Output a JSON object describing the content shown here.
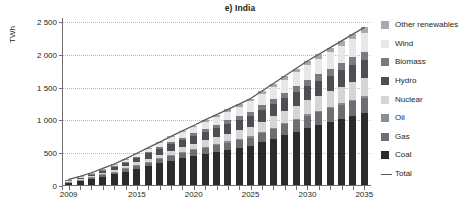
{
  "chart_data": {
    "type": "bar",
    "stacked": true,
    "title": "e) India",
    "xlabel": "",
    "ylabel": "TWh",
    "ylim": [
      0,
      2500
    ],
    "yticks": [
      0,
      500,
      1000,
      1500,
      2000,
      2500
    ],
    "ytick_labels": [
      "0",
      "500",
      "1 000",
      "1 500",
      "2 000",
      "2 500"
    ],
    "grid": true,
    "legend_position": "right",
    "categories": [
      2009,
      2010,
      2011,
      2012,
      2013,
      2014,
      2015,
      2016,
      2017,
      2018,
      2019,
      2020,
      2021,
      2022,
      2023,
      2024,
      2025,
      2026,
      2027,
      2028,
      2029,
      2030,
      2031,
      2032,
      2033,
      2034,
      2035
    ],
    "xtick_labels": [
      "2009",
      "2015",
      "2020",
      "2025",
      "2030",
      "2035"
    ],
    "xticks": [
      2009,
      2015,
      2020,
      2025,
      2030,
      2035
    ],
    "series": [
      {
        "name": "Coal",
        "color": "#2b2b2b",
        "values": [
          55,
          80,
          110,
          145,
          180,
          220,
          265,
          305,
          345,
          385,
          420,
          455,
          490,
          520,
          550,
          580,
          610,
          665,
          720,
          775,
          830,
          885,
          930,
          975,
          1020,
          1065,
          1110
        ]
      },
      {
        "name": "Gas",
        "color": "#6d6e71",
        "values": [
          8,
          12,
          18,
          24,
          31,
          39,
          47,
          56,
          64,
          72,
          80,
          88,
          96,
          104,
          112,
          120,
          128,
          140,
          152,
          164,
          176,
          188,
          198,
          208,
          218,
          228,
          238
        ]
      },
      {
        "name": "Oil",
        "color": "#8c8d8f",
        "values": [
          4,
          5,
          6,
          7,
          8,
          9,
          10,
          11,
          12,
          13,
          14,
          15,
          16,
          16,
          17,
          17,
          18,
          18,
          19,
          19,
          20,
          20,
          21,
          21,
          22,
          22,
          23
        ]
      },
      {
        "name": "Nuclear",
        "color": "#d4d5d7",
        "values": [
          5,
          8,
          12,
          17,
          23,
          30,
          38,
          47,
          56,
          66,
          76,
          86,
          97,
          108,
          119,
          130,
          142,
          156,
          170,
          184,
          198,
          212,
          226,
          240,
          254,
          268,
          282
        ]
      },
      {
        "name": "Hydro",
        "color": "#4e4f52",
        "values": [
          20,
          26,
          33,
          41,
          49,
          58,
          67,
          77,
          87,
          97,
          107,
          117,
          127,
          137,
          147,
          157,
          167,
          177,
          187,
          197,
          207,
          217,
          227,
          237,
          247,
          257,
          267
        ]
      },
      {
        "name": "Biomass",
        "color": "#7a7b7e",
        "values": [
          3,
          5,
          7,
          10,
          13,
          16,
          20,
          24,
          28,
          32,
          37,
          42,
          47,
          52,
          57,
          62,
          68,
          74,
          80,
          86,
          92,
          98,
          104,
          110,
          116,
          122,
          128
        ]
      },
      {
        "name": "Wind",
        "color": "#e6e7e8",
        "values": [
          5,
          9,
          14,
          20,
          27,
          35,
          44,
          54,
          64,
          75,
          86,
          97,
          109,
          121,
          133,
          145,
          158,
          171,
          184,
          197,
          210,
          223,
          236,
          249,
          262,
          275,
          288
        ]
      },
      {
        "name": "Other renewables",
        "color": "#a7a9ac",
        "values": [
          0,
          1,
          2,
          3,
          4,
          6,
          8,
          10,
          13,
          16,
          19,
          22,
          26,
          30,
          34,
          38,
          42,
          46,
          50,
          54,
          58,
          62,
          66,
          70,
          74,
          78,
          82
        ]
      }
    ],
    "total_line": {
      "name": "Total",
      "color": "#58595b",
      "values": [
        100,
        146,
        202,
        267,
        335,
        413,
        499,
        584,
        669,
        756,
        839,
        922,
        1008,
        1088,
        1169,
        1249,
        1333,
        1447,
        1562,
        1676,
        1791,
        1905,
        2008,
        2110,
        2213,
        2315,
        2418
      ]
    }
  },
  "legend": {
    "items": [
      {
        "label": "Other renewables",
        "color": "#a7a9ac",
        "marker": "swatch"
      },
      {
        "label": "Wind",
        "color": "#e6e7e8",
        "marker": "swatch"
      },
      {
        "label": "Biomass",
        "color": "#7a7b7e",
        "marker": "swatch"
      },
      {
        "label": "Hydro",
        "color": "#4e4f52",
        "marker": "swatch"
      },
      {
        "label": "Nuclear",
        "color": "#d4d5d7",
        "marker": "swatch"
      },
      {
        "label": "Oil",
        "color": "#8c8d8f",
        "marker": "swatch"
      },
      {
        "label": "Gas",
        "color": "#6d6e71",
        "marker": "swatch"
      },
      {
        "label": "Coal",
        "color": "#2b2b2b",
        "marker": "swatch"
      },
      {
        "label": "Total",
        "color": "#58595b",
        "marker": "line"
      }
    ]
  }
}
